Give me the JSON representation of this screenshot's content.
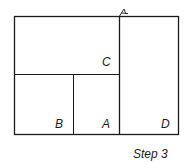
{
  "diagram": {
    "caption": "Step 3",
    "regions": [
      {
        "id": "C",
        "label": "C"
      },
      {
        "id": "B",
        "label": "B"
      },
      {
        "id": "A",
        "label": "A"
      },
      {
        "id": "D",
        "label": "D"
      }
    ],
    "marker": "fold-tick",
    "colors": {
      "line": "#1a1a1a",
      "background": "#ffffff"
    }
  }
}
